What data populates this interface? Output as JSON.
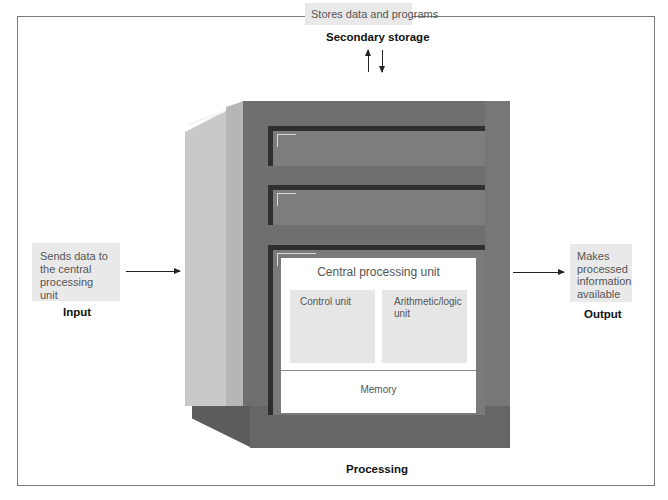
{
  "secondary_storage": {
    "description": "Stores data and programs",
    "label": "Secondary storage"
  },
  "input": {
    "description": "Sends data to the central processing unit",
    "description_lines": [
      "Sends data to",
      "the central",
      "processing unit"
    ],
    "label": "Input"
  },
  "output": {
    "description": "Makes processed information available",
    "description_lines": [
      "Makes",
      "processed",
      "information",
      "available"
    ],
    "label": "Output"
  },
  "processing": {
    "label": "Processing",
    "cpu": {
      "title": "Central processing unit",
      "control_unit": "Control unit",
      "alu": "Arithmetic/logic unit",
      "memory": "Memory"
    }
  },
  "colors": {
    "note_bg": "#e9e9e9",
    "cabinet_front": "#6f6f6f",
    "cabinet_side": "#c9c9c9",
    "drive_bar": "#2f2f2f"
  }
}
